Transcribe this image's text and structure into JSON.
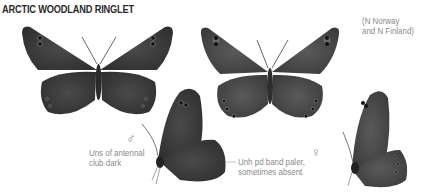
{
  "title": "ARCTIC WOODLAND RINGLET",
  "range_note": [
    "(N Norway",
    "and N Finland)"
  ],
  "male_symbol": "♂",
  "female_symbol": "♀",
  "annotations": {
    "antenna": [
      "Uns of antennal",
      "club dark"
    ],
    "band": [
      "Unh pd band paler,",
      "sometimes absent"
    ]
  },
  "figures": [
    {
      "id": "male-upperside",
      "sex": "male",
      "view": "upperside"
    },
    {
      "id": "female-upperside",
      "sex": "female",
      "view": "upperside"
    },
    {
      "id": "male-underside",
      "sex": "male",
      "view": "underside"
    },
    {
      "id": "female-underside",
      "sex": "female",
      "view": "underside"
    }
  ],
  "colors": {
    "wing_dark": "#3a3a3a",
    "wing_mid": "#555555",
    "text_gray": "#8a8a8a"
  }
}
